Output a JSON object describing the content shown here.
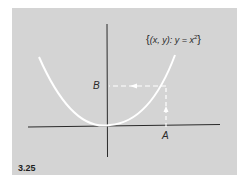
{
  "figure": {
    "number": "3.25",
    "set_label": {
      "open_brace": "{",
      "text": "(x, y): y = x",
      "exponent": "2",
      "close_brace": "}"
    },
    "points": {
      "a_label": "A",
      "b_label": "B"
    },
    "colors": {
      "panel_background": "#d4d4d4",
      "axes": "#2a2a2a",
      "curve": "#ffffff",
      "dashed_arrows": "#ffffff",
      "text": "#2a2a2a"
    }
  }
}
